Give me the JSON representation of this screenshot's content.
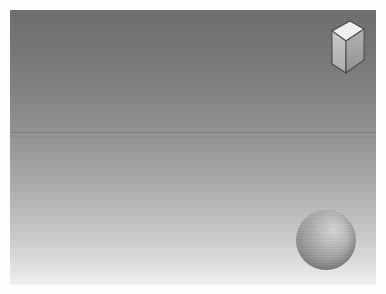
{
  "scene": {
    "title": "3D Rendered Scene",
    "caption": "",
    "canvas": {
      "width_px": 366,
      "height_px": 275,
      "frame_margin_px": 10,
      "paper_color": "#fdfdfd"
    },
    "background": {
      "name": "vertical-gradient-backdrop",
      "type": "linear-gradient",
      "direction": "top-to-bottom",
      "top_color": "#6d6d6d",
      "mid_color": "#a8a8a8",
      "bottom_color": "#f7f7f7",
      "texture": "film-grain-scanlines"
    },
    "objects": [
      {
        "name": "cube",
        "shape": "cube",
        "label": "Cube",
        "position": {
          "x_px": 318,
          "y_px": 15
        },
        "size_px": 46,
        "faces": {
          "top": {
            "label": "top-face",
            "color": "#f0f0ee"
          },
          "left": {
            "label": "left-face",
            "color": "#c2c2c0"
          },
          "right": {
            "label": "right-face",
            "color": "#a7a7a5"
          }
        },
        "edge_color": "#4a4a4a"
      },
      {
        "name": "sphere",
        "shape": "sphere",
        "label": "Sphere",
        "center_px": {
          "x": 326,
          "y": 240
        },
        "radius_px": 30,
        "highlight_color": "#d6d6d6",
        "base_color": "#9b9b9b",
        "shadow_color": "#7d7d7d",
        "highlight_position": "upper-right"
      }
    ],
    "lighting": {
      "key_light_direction": "upper-right",
      "shading_model": "smooth"
    }
  }
}
